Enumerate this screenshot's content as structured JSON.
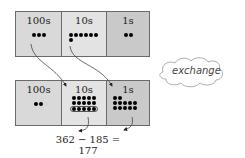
{
  "diagram": {
    "top_row": {
      "boxes": [
        {
          "label": "100s",
          "dots": 3
        },
        {
          "label": "10s",
          "dots": 6
        },
        {
          "label": "1s",
          "dots": 2
        }
      ]
    },
    "bottom_row": {
      "boxes": [
        {
          "label": "100s",
          "dots": 2
        },
        {
          "label": "10s",
          "dots": 15
        },
        {
          "label": "1s",
          "dots": 12
        }
      ]
    },
    "callout": "exchange",
    "equation": "362 − 185 = 177",
    "colors": {
      "box_100s": "#d9d9d9",
      "box_10s": "#e3e3e3",
      "box_1s": "#c9c9c9",
      "border": "#6a6a6a",
      "dot": "#000000"
    }
  }
}
